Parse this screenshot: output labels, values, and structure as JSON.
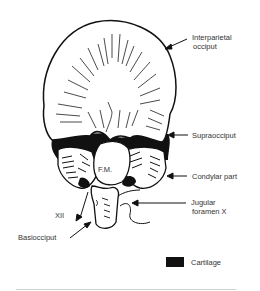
{
  "diagram": {
    "labels": {
      "interparietal": [
        "Interparietal",
        "occiput"
      ],
      "supraocciput": "Supraocciput",
      "condylar": "Condylar part",
      "jugular": [
        "Jugular",
        "foramen X"
      ],
      "fm": "F.M.",
      "xii": "XII",
      "basiocciput": "Basiocciput"
    },
    "legend": {
      "items": [
        {
          "label": "Cartilage",
          "color": "#111111"
        }
      ]
    },
    "colors": {
      "line": "#111111",
      "fill": "#ffffff",
      "cartilage": "#111111"
    }
  }
}
